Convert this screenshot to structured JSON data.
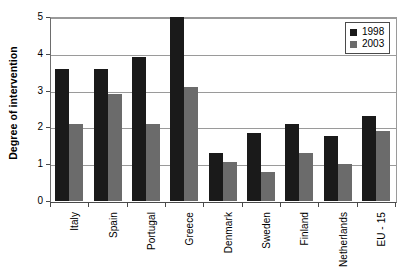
{
  "chart_data": {
    "type": "bar",
    "title": "",
    "xlabel": "",
    "ylabel": "Degree of intervention",
    "ylim": [
      0,
      5
    ],
    "yticks": [
      0,
      1,
      2,
      3,
      4,
      5
    ],
    "grid": true,
    "legend_position": "top-right",
    "categories": [
      "Italy",
      "Spain",
      "Portugal",
      "Greece",
      "Denmark",
      "Sweden",
      "Finland",
      "Netherlands",
      "EU - 15"
    ],
    "series": [
      {
        "name": "1998",
        "color": "#1a1a1a",
        "values": [
          3.6,
          3.6,
          3.9,
          5.0,
          1.3,
          1.85,
          2.1,
          1.77,
          2.3
        ]
      },
      {
        "name": "2003",
        "color": "#6b6b6b",
        "values": [
          2.1,
          2.9,
          2.1,
          3.1,
          1.05,
          0.8,
          1.3,
          1.0,
          1.9
        ]
      }
    ]
  },
  "axis": {
    "y_title": "Degree of intervention",
    "y_tick_labels": [
      "0",
      "1",
      "2",
      "3",
      "4",
      "5"
    ]
  },
  "legend": {
    "entries": [
      {
        "label": "1998",
        "color": "#1a1a1a"
      },
      {
        "label": "2003",
        "color": "#6b6b6b"
      }
    ]
  }
}
